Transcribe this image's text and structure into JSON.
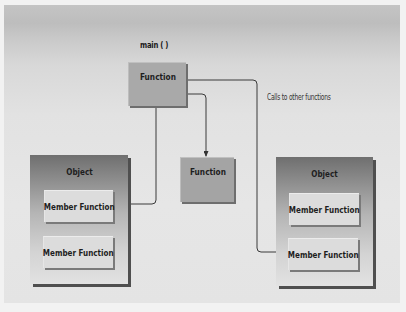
{
  "diagram": {
    "main_label": "main ( )",
    "calls_label": "Calls to other functions",
    "main_function": {
      "label": "Function"
    },
    "standalone_function": {
      "label": "Function"
    },
    "objects": [
      {
        "title": "Object",
        "members": [
          {
            "label": "Member Function"
          },
          {
            "label": "Member Function"
          }
        ]
      },
      {
        "title": "Object",
        "members": [
          {
            "label": "Member Function"
          },
          {
            "label": "Member Function"
          }
        ]
      }
    ],
    "connections": [
      {
        "from": "main_function",
        "to": "objects.0.members.0"
      },
      {
        "from": "main_function",
        "to": "standalone_function"
      },
      {
        "from": "main_function",
        "to": "objects.1.members.1"
      }
    ]
  }
}
